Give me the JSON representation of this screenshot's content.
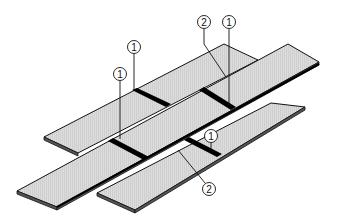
{
  "diagram": {
    "type": "isometric-technical-illustration",
    "colors": {
      "board_face": "#d9d9d9",
      "board_edge": "#555555",
      "outline": "#111111",
      "joint": "#000000",
      "background": "#ffffff"
    },
    "callouts": [
      {
        "id": "c1",
        "label": "1",
        "x": 134,
        "y": 47
      },
      {
        "id": "c2",
        "label": "1",
        "x": 120,
        "y": 74
      },
      {
        "id": "c3",
        "label": "2",
        "x": 204,
        "y": 22
      },
      {
        "id": "c4",
        "label": "1",
        "x": 229,
        "y": 22
      },
      {
        "id": "c5",
        "label": "1",
        "x": 211,
        "y": 136
      },
      {
        "id": "c6",
        "label": "2",
        "x": 209,
        "y": 189
      }
    ]
  }
}
